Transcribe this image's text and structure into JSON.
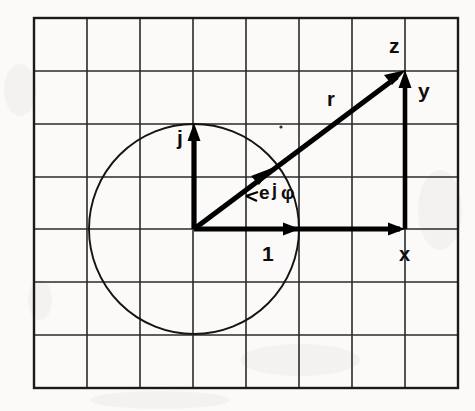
{
  "figure": {
    "background_color": "#fbfaf8",
    "ink_color": "#000000",
    "grid_color": "#2a2a2a"
  },
  "grid": {
    "columns": 8,
    "rows": 7,
    "x_positions": [
      34,
      87,
      140,
      193,
      246,
      299,
      352,
      405,
      458
    ],
    "y_positions": [
      18,
      71,
      124,
      177,
      229,
      282,
      335,
      388
    ],
    "cell_width": 53,
    "cell_height": 53
  },
  "geometry": {
    "origin": {
      "x": 194,
      "y": 229
    },
    "unit_length": 105,
    "circle": {
      "cx": 194,
      "cy": 229,
      "r": 105
    },
    "point_z": {
      "x": 405,
      "y": 71
    },
    "unit_real_tip": {
      "x": 299,
      "y": 229
    },
    "unit_imag_tip": {
      "x": 194,
      "y": 124
    },
    "x_component_tip": {
      "x": 405,
      "y": 229
    },
    "y_component_base": {
      "x": 405,
      "y": 229
    },
    "phasor_tip": {
      "x": 268,
      "y": 172
    },
    "angle_phi_degrees": 36.8
  },
  "labels": {
    "z": "z",
    "r": "r",
    "y": "y",
    "x": "x",
    "one": "1",
    "j": "j",
    "phasor_e": "e",
    "phasor_j": "j",
    "phasor_phi": "φ"
  },
  "label_positions": {
    "z": {
      "x": 389,
      "y": 53
    },
    "r": {
      "x": 327,
      "y": 105
    },
    "y": {
      "x": 419,
      "y": 97
    },
    "x": {
      "x": 400,
      "y": 259
    },
    "one": {
      "x": 262,
      "y": 259
    },
    "j": {
      "x": 179,
      "y": 142
    },
    "phasor": {
      "x": 258,
      "y": 198
    }
  },
  "vectors": [
    {
      "name": "unit-real",
      "label": "1",
      "from": "origin",
      "to": "unit_real_tip",
      "kind": "basis"
    },
    {
      "name": "unit-imaginary",
      "label": "j",
      "from": "origin",
      "to": "unit_imag_tip",
      "kind": "basis"
    },
    {
      "name": "unit-phasor",
      "label": "e j φ",
      "from": "origin",
      "to": "phasor_tip",
      "kind": "phasor"
    },
    {
      "name": "resultant",
      "label": "r",
      "from": "origin",
      "to": "point_z",
      "kind": "resultant"
    },
    {
      "name": "real-component",
      "label": "x",
      "from": "origin",
      "to": "x_component_tip",
      "kind": "component"
    },
    {
      "name": "imaginary-component",
      "label": "y",
      "from": "x_component_tip",
      "to": "point_z",
      "kind": "component"
    }
  ]
}
